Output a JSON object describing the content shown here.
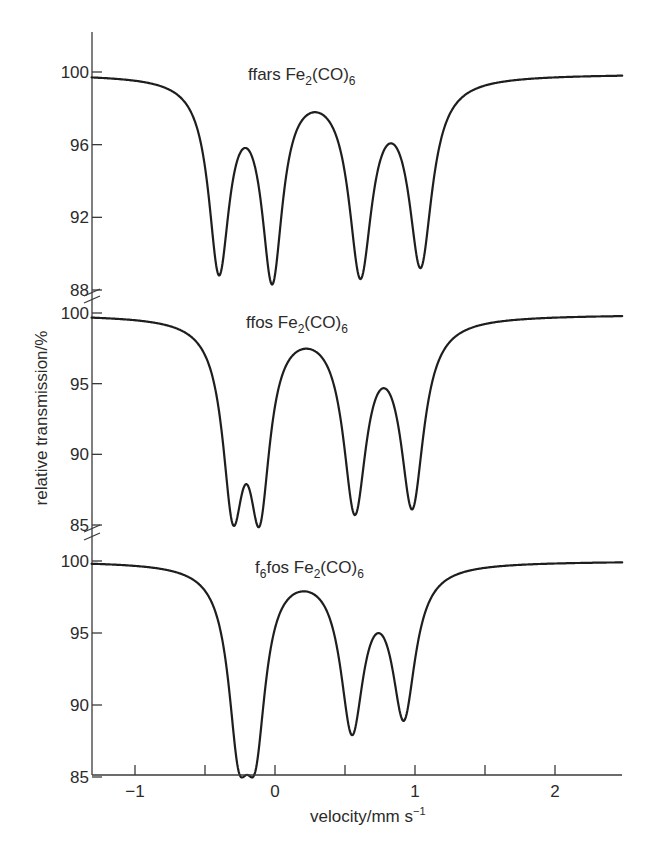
{
  "chart_data": {
    "type": "line",
    "title": "",
    "xlabel": "velocity/mm s⁻¹",
    "xlabel_main": "velocity/mm s",
    "xlabel_sup": "−1",
    "ylabel": "relative transmission/%",
    "xlim": [
      -1.31,
      2.48
    ],
    "x_ticks": [
      -1,
      -0.5,
      0,
      0.5,
      1,
      1.5,
      2
    ],
    "x_tick_labels": {
      "-1": "−1",
      "0": "0",
      "1": "1",
      "2": "2"
    },
    "grid": false,
    "legend": "none",
    "panels": [
      {
        "name": "ffars Fe2(CO)6",
        "title_main": "ffars Fe",
        "title_sub1": "2",
        "title_mid": "(CO)",
        "title_sub2": "6",
        "ylim": [
          88,
          102.2
        ],
        "y_ticks": [
          88,
          92,
          96,
          100
        ],
        "y_tick_labels": [
          "88",
          "92",
          "96",
          "100"
        ],
        "x": [
          -1.31,
          -0.8,
          -0.5,
          -0.4,
          -0.21,
          -0.02,
          0.27,
          0.61,
          0.84,
          1.04,
          1.3,
          2.48
        ],
        "y": [
          99.6,
          98.8,
          96.0,
          88.8,
          93.6,
          88.3,
          96.8,
          88.6,
          94.7,
          89.2,
          98.0,
          99.9
        ],
        "minima": [
          {
            "v": -0.4,
            "t": 88.8
          },
          {
            "v": -0.02,
            "t": 88.3
          },
          {
            "v": 0.61,
            "t": 88.6
          },
          {
            "v": 1.04,
            "t": 89.2
          }
        ],
        "maxima": [
          {
            "v": -0.21,
            "t": 93.6
          },
          {
            "v": 0.27,
            "t": 96.8
          },
          {
            "v": 0.84,
            "t": 94.7
          }
        ]
      },
      {
        "name": "ffos Fe2(CO)6",
        "title_main": "ffos Fe",
        "title_sub1": "2",
        "title_mid": "(CO)",
        "title_sub2": "6",
        "ylim": [
          85,
          101.4
        ],
        "y_ticks": [
          85,
          90,
          95,
          100
        ],
        "y_tick_labels": [
          "85",
          "90",
          "95",
          "100"
        ],
        "x": [
          -1.31,
          -0.8,
          -0.5,
          -0.3,
          -0.21,
          -0.11,
          0.24,
          0.57,
          0.79,
          0.98,
          1.3,
          2.48
        ],
        "y": [
          99.6,
          98.6,
          95.0,
          85.0,
          86.3,
          84.9,
          95.8,
          85.7,
          92.5,
          86.1,
          98.0,
          99.9
        ],
        "minima": [
          {
            "v": -0.3,
            "t": 85.0
          },
          {
            "v": -0.11,
            "t": 84.9
          },
          {
            "v": 0.57,
            "t": 85.7
          },
          {
            "v": 0.98,
            "t": 86.1
          }
        ],
        "maxima": [
          {
            "v": -0.21,
            "t": 86.3
          },
          {
            "v": 0.24,
            "t": 95.8
          },
          {
            "v": 0.79,
            "t": 92.5
          }
        ]
      },
      {
        "name": "f6fos Fe2(CO)6",
        "title_main": "f",
        "title_sub0": "6",
        "title_main2": "fos Fe",
        "title_sub1": "2",
        "title_mid": "(CO)",
        "title_sub2": "6",
        "ylim": [
          85,
          101.2
        ],
        "y_ticks": [
          85,
          90,
          95,
          100
        ],
        "y_tick_labels": [
          "85",
          "90",
          "95",
          "100"
        ],
        "x": [
          -1.31,
          -0.8,
          -0.5,
          -0.26,
          -0.19,
          -0.14,
          0.22,
          0.55,
          0.75,
          0.92,
          1.2,
          2.48
        ],
        "y": [
          99.8,
          99.0,
          96.5,
          85.4,
          86.2,
          85.4,
          97.0,
          87.9,
          93.9,
          88.9,
          98.3,
          100.0
        ],
        "minima": [
          {
            "v": -0.26,
            "t": 85.4
          },
          {
            "v": -0.14,
            "t": 85.4
          },
          {
            "v": 0.55,
            "t": 87.9
          },
          {
            "v": 0.92,
            "t": 88.9
          }
        ],
        "maxima": [
          {
            "v": -0.19,
            "t": 86.2
          },
          {
            "v": 0.22,
            "t": 97.0
          },
          {
            "v": 0.75,
            "t": 93.9
          }
        ]
      }
    ]
  }
}
